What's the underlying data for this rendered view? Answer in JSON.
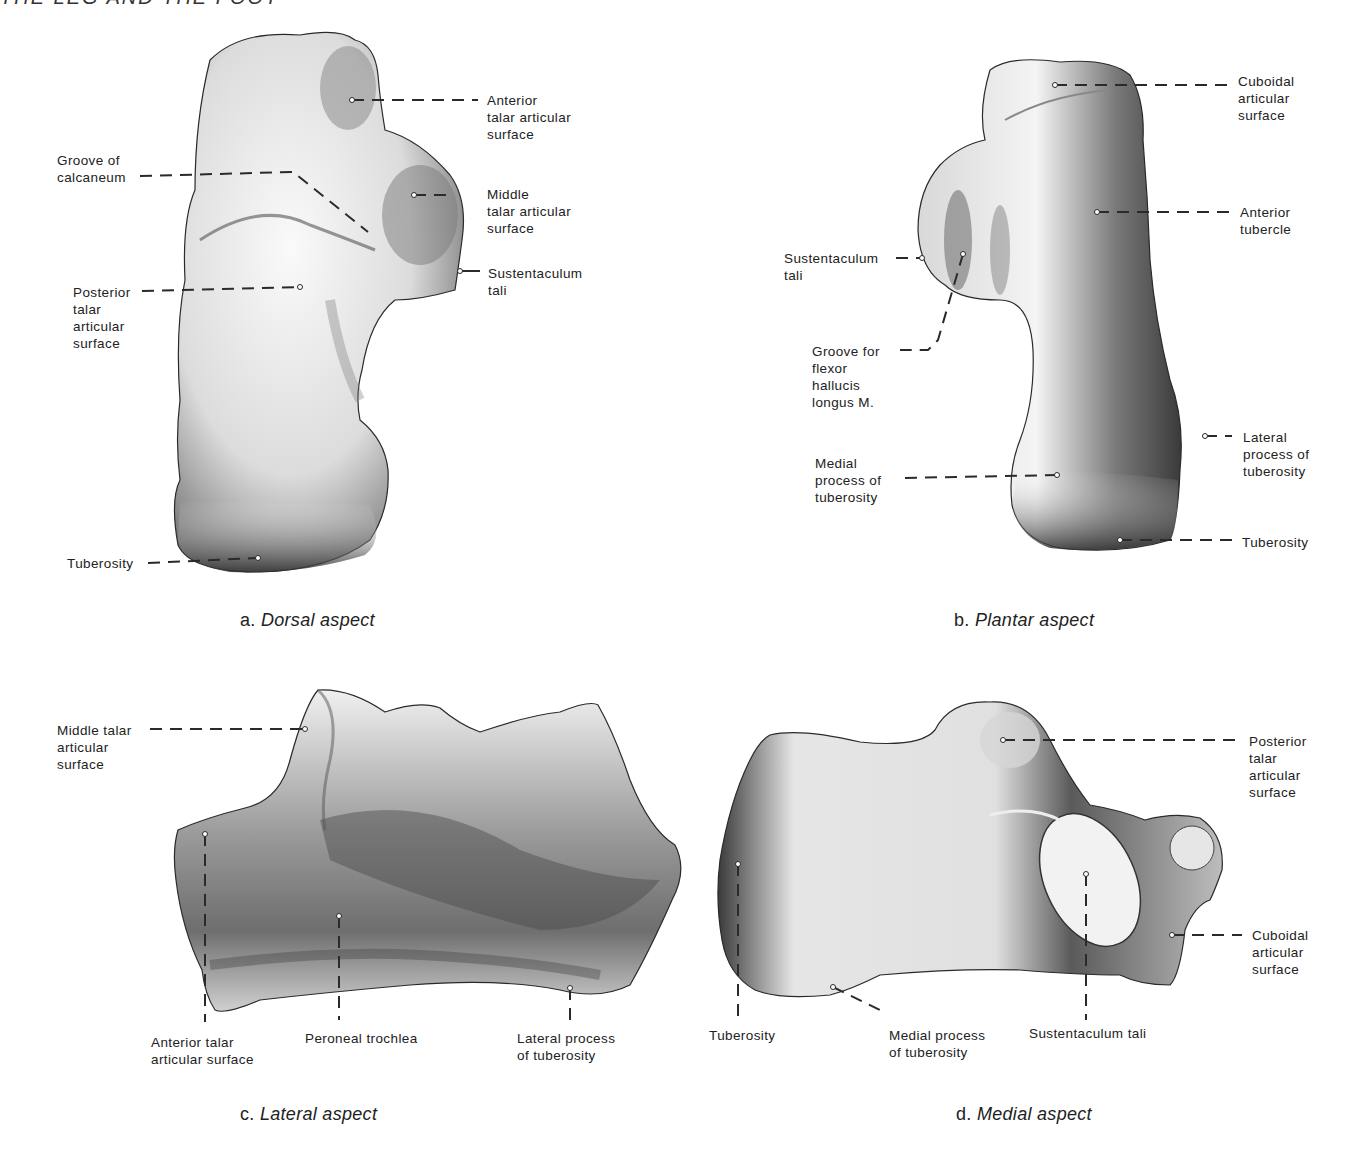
{
  "page": {
    "running_head": "THE LEG AND THE FOOT"
  },
  "panels": {
    "a": {
      "letter": "a.",
      "title": "Dorsal aspect",
      "labels": {
        "anterior_talar": "Anterior\ntalar articular\nsurface",
        "groove_calcaneum": "Groove of\ncalcaneum",
        "middle_talar": "Middle\ntalar articular\nsurface",
        "sustentaculum": "Sustentaculum\ntali",
        "posterior_talar": "Posterior\ntalar\narticular\nsurface",
        "tuberosity": "Tuberosity"
      }
    },
    "b": {
      "letter": "b.",
      "title": "Plantar aspect",
      "labels": {
        "cuboidal": "Cuboidal\narticular\nsurface",
        "anterior_tubercle": "Anterior\ntubercle",
        "sustentaculum": "Sustentaculum\ntali",
        "groove_fhl": "Groove for\nflexor\nhallucis\nlongus M.",
        "lateral_process": "Lateral\nprocess of\ntuberosity",
        "medial_process": "Medial\nprocess of\ntuberosity",
        "tuberosity": "Tuberosity"
      }
    },
    "c": {
      "letter": "c.",
      "title": "Lateral aspect",
      "labels": {
        "middle_talar": "Middle talar\narticular\nsurface",
        "anterior_talar": "Anterior talar\narticular surface",
        "peroneal_trochlea": "Peroneal trochlea",
        "lateral_process": "Lateral process\nof tuberosity"
      }
    },
    "d": {
      "letter": "d.",
      "title": "Medial aspect",
      "labels": {
        "posterior_talar": "Posterior\ntalar\narticular\nsurface",
        "cuboidal": "Cuboidal\narticular\nsurface",
        "tuberosity": "Tuberosity",
        "medial_process": "Medial process\nof tuberosity",
        "sustentaculum": "Sustentaculum tali"
      }
    }
  },
  "colors": {
    "bone_light": "#f2f2f2",
    "bone_mid": "#a8a8a8",
    "bone_dark": "#3c3c3c",
    "leader": "#2a2a2a"
  }
}
